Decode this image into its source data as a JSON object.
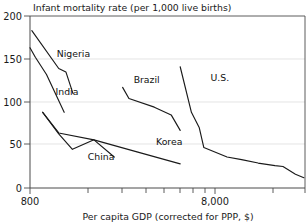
{
  "chart_data": {
    "type": "line",
    "title": "Infant mortality rate (per 1,000 live births)",
    "xlabel": "Per capita GDP (corrected for PPP, $)",
    "ylabel": "Infant mortality rate (per 1,000 live births)",
    "xscale": "log",
    "yscale": "linear",
    "xlim": [
      800,
      33000
    ],
    "ylim": [
      0,
      200
    ],
    "grid": "horizontal-faint",
    "legend": "inline-labels",
    "ytick_labels": [
      "0",
      "50",
      "100",
      "150",
      "200"
    ],
    "ytick_values": [
      0,
      50,
      100,
      150,
      200
    ],
    "xtick_labels": [
      "800",
      "8,000"
    ],
    "xtick_values": [
      800,
      8000
    ],
    "series": [
      {
        "name": "Nigeria",
        "label": "Nigeria",
        "points": [
          {
            "x": 820,
            "y": 183
          },
          {
            "x": 1180,
            "y": 139
          },
          {
            "x": 1300,
            "y": 135
          },
          {
            "x": 1430,
            "y": 110
          }
        ]
      },
      {
        "name": "India",
        "label": "India",
        "points": [
          {
            "x": 800,
            "y": 163
          },
          {
            "x": 860,
            "y": 152
          },
          {
            "x": 1000,
            "y": 132
          },
          {
            "x": 1270,
            "y": 88
          }
        ]
      },
      {
        "name": "China",
        "label": "China",
        "points": [
          {
            "x": 950,
            "y": 88
          },
          {
            "x": 1180,
            "y": 63
          },
          {
            "x": 1420,
            "y": 45
          },
          {
            "x": 1900,
            "y": 56
          },
          {
            "x": 2500,
            "y": 36
          }
        ]
      },
      {
        "name": "Korea",
        "label": "Korea",
        "points": [
          {
            "x": 950,
            "y": 88
          },
          {
            "x": 1180,
            "y": 64
          },
          {
            "x": 1900,
            "y": 56
          },
          {
            "x": 3400,
            "y": 42
          },
          {
            "x": 6100,
            "y": 28
          }
        ]
      },
      {
        "name": "Brazil",
        "label": "Brazil",
        "points": [
          {
            "x": 2800,
            "y": 117
          },
          {
            "x": 3050,
            "y": 104
          },
          {
            "x": 4300,
            "y": 94
          },
          {
            "x": 5400,
            "y": 85
          },
          {
            "x": 6100,
            "y": 67
          }
        ]
      },
      {
        "name": "U.S.",
        "label": "U.S.",
        "points": [
          {
            "x": 6100,
            "y": 141
          },
          {
            "x": 7100,
            "y": 88
          },
          {
            "x": 7900,
            "y": 70
          },
          {
            "x": 8400,
            "y": 47
          },
          {
            "x": 11500,
            "y": 36
          },
          {
            "x": 14000,
            "y": 33
          },
          {
            "x": 17500,
            "y": 29
          },
          {
            "x": 22000,
            "y": 26
          },
          {
            "x": 24500,
            "y": 25
          },
          {
            "x": 29000,
            "y": 16
          },
          {
            "x": 32500,
            "y": 12
          }
        ]
      }
    ],
    "annotations": [
      {
        "text": "Nigeria",
        "x": 1150,
        "y": 152
      },
      {
        "text": "India",
        "x": 1130,
        "y": 108
      },
      {
        "text": "China",
        "x": 1750,
        "y": 33
      },
      {
        "text": "Korea",
        "x": 4400,
        "y": 50
      },
      {
        "text": "Brazil",
        "x": 3250,
        "y": 122
      },
      {
        "text": "U.S.",
        "x": 9200,
        "y": 125
      }
    ]
  }
}
